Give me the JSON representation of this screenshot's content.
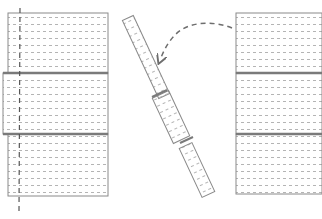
{
  "diagram": {
    "colors": {
      "outline": "#8a8a8a",
      "thick_joint": "#7a7a7a",
      "dots": "#b4b4b4",
      "dashed_line": "#555555",
      "arrow": "#6e6e6e",
      "background": "#ffffff"
    },
    "left_stack": {
      "blocks": [
        {
          "x": 8,
          "y": 13,
          "w": 100,
          "h": 60
        },
        {
          "x": 3,
          "y": 73,
          "w": 105,
          "h": 61
        },
        {
          "x": 8,
          "y": 134,
          "w": 100,
          "h": 62
        }
      ],
      "axis": {
        "x": 20,
        "y1": 8,
        "y2": 210
      }
    },
    "tilted_column": {
      "segments": [
        {
          "cx": 146,
          "cy": 57,
          "w": 11,
          "h": 86
        },
        {
          "cx": 171,
          "cy": 116,
          "w": 18,
          "h": 50
        },
        {
          "cx": 197,
          "cy": 169,
          "w": 14,
          "h": 56
        }
      ],
      "angle_deg": -25
    },
    "right_stack": {
      "blocks": [
        {
          "x": 236,
          "y": 13,
          "w": 86,
          "h": 60
        },
        {
          "x": 236,
          "y": 73,
          "w": 86,
          "h": 61
        },
        {
          "x": 236,
          "y": 134,
          "w": 86,
          "h": 60
        }
      ]
    },
    "arrow": {
      "from": [
        232,
        28
      ],
      "to": [
        160,
        62
      ],
      "style": "dashed-curved"
    }
  }
}
